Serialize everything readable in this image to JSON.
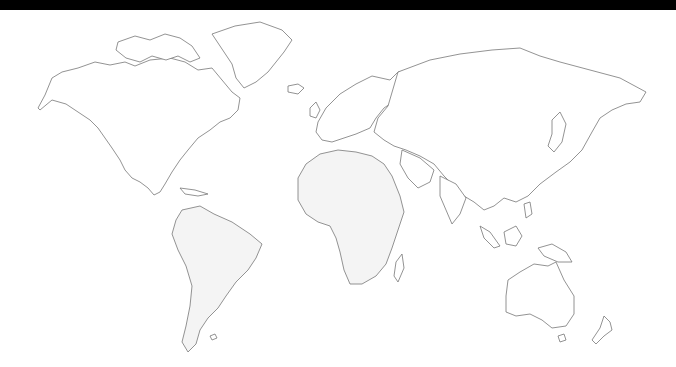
{
  "map": {
    "title": "World map outline",
    "style": "blank outline, no labels",
    "colors": {
      "background": "#ffffff",
      "land_fill": "#ffffff",
      "land_fill_shaded": "#f4f4f4",
      "coastline": "#777777",
      "top_bar": "#000000"
    },
    "regions": [
      {
        "name": "North America",
        "shaded": false
      },
      {
        "name": "Greenland",
        "shaded": false
      },
      {
        "name": "South America",
        "shaded": true
      },
      {
        "name": "Europe",
        "shaded": false
      },
      {
        "name": "Africa",
        "shaded": true
      },
      {
        "name": "Asia",
        "shaded": false
      },
      {
        "name": "Australia",
        "shaded": false
      },
      {
        "name": "New Zealand",
        "shaded": false
      },
      {
        "name": "Madagascar",
        "shaded": false
      },
      {
        "name": "Iceland",
        "shaded": false
      },
      {
        "name": "Japan",
        "shaded": false
      },
      {
        "name": "Indonesia",
        "shaded": false
      },
      {
        "name": "United Kingdom",
        "shaded": false
      }
    ]
  }
}
